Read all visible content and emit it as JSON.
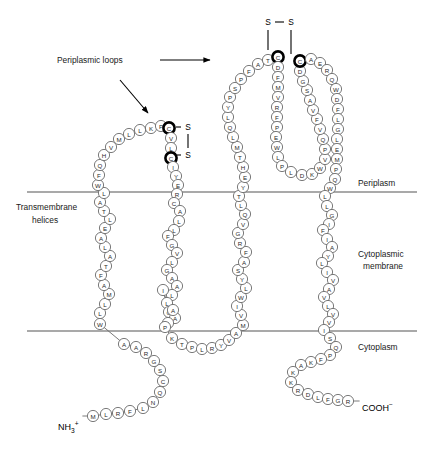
{
  "figure": {
    "annotations": {
      "periplasmic_loops": "Periplasmic loops",
      "transmembrane_helices_line1": "Transmembrane",
      "transmembrane_helices_line2": "helices"
    },
    "regions": {
      "periplasm": "Periplasm",
      "cytoplasmic_membrane_line1": "Cytoplasmic",
      "cytoplasmic_membrane_line2": "membrane",
      "cytoplasm": "Cytoplasm"
    },
    "termini": {
      "n_terminus_main": "NH",
      "n_terminus_sub": "3",
      "n_terminus_sup": "+",
      "c_terminus_main": "COOH",
      "c_terminus_sup": "−"
    },
    "disulfides": [
      {
        "name": "upper-disulfide",
        "label_left": "S",
        "label_right": "S",
        "orientation": "horizontal"
      },
      {
        "name": "lower-disulfide",
        "label_top": "S",
        "label_bottom": "S",
        "orientation": "vertical"
      }
    ],
    "colors": {
      "residue_stroke": "#6b6b6b",
      "residue_fill": "#ffffff",
      "bold_residue_stroke": "#000000",
      "membrane_line": "#555555",
      "text": "#1a1a1a"
    }
  },
  "sequence": {
    "n_terminal_tail": [
      "M",
      "L",
      "R",
      "F",
      "L",
      "N",
      "Q",
      "C",
      "S",
      "G",
      "R",
      "A",
      "A"
    ],
    "tm_helix_1": [
      "W",
      "L",
      "L",
      "M",
      "A",
      "F",
      "T",
      "A",
      "L",
      "A",
      "E",
      "L",
      "T",
      "A",
      "L",
      "W",
      "F"
    ],
    "periplasmic_loop_1": [
      "Q",
      "H",
      "V",
      "M",
      "L",
      "L",
      "K",
      "P",
      "C",
      "V",
      "L",
      "C",
      "I",
      "Y",
      "E",
      "R"
    ],
    "tm_helix_2": [
      "C",
      "A",
      "L",
      "L",
      "F",
      "G",
      "V",
      "L",
      "G",
      "A",
      "A",
      "L",
      "L",
      "I",
      "G",
      "A",
      "I",
      "A",
      "P"
    ],
    "cytoplasmic_loop_1": [
      "K",
      "T",
      "P",
      "L",
      "R",
      "Y",
      "V",
      "A"
    ],
    "tm_helix_3": [
      "M",
      "V",
      "I",
      "W",
      "L",
      "Y",
      "S",
      "A",
      "F",
      "R",
      "G",
      "V",
      "Q",
      "L",
      "T",
      "Y",
      "E"
    ],
    "periplasmic_loop_2_ascend": [
      "H",
      "T",
      "M",
      "L",
      "Q",
      "L",
      "Y",
      "P",
      "S",
      "P",
      "F",
      "A",
      "T"
    ],
    "periplasmic_loop_2_inner_down": [
      "C",
      "D",
      "F",
      "M",
      "V",
      "R",
      "F",
      "P",
      "E",
      "W",
      "L",
      "P"
    ],
    "periplasmic_loop_2_inner_bottom": [
      "L",
      "D",
      "K",
      "W"
    ],
    "periplasmic_loop_2_inner_up": [
      "V",
      "P",
      "Q",
      "V",
      "F",
      "V",
      "A",
      "S",
      "G",
      "D",
      "C"
    ],
    "periplasmic_loop_2_descend": [
      "A",
      "E",
      "R",
      "Q",
      "W",
      "D",
      "F",
      "L",
      "G",
      "L",
      "E",
      "M",
      "P",
      "Q"
    ],
    "tm_helix_4": [
      "W",
      "L",
      "L",
      "G",
      "I",
      "F",
      "I",
      "A",
      "Y",
      "L",
      "I",
      "V",
      "A",
      "V",
      "L",
      "V",
      "V",
      "I",
      "S"
    ],
    "c_terminal_tail": [
      "Q",
      "P",
      "F",
      "K",
      "A",
      "K",
      "K",
      "R",
      "D",
      "L",
      "F",
      "G",
      "R"
    ],
    "bold_residues": [
      "periplasmic_loop_1.8",
      "periplasmic_loop_1.11",
      "periplasmic_loop_2_inner_down.0",
      "periplasmic_loop_2_inner_up.10"
    ]
  },
  "geometry": {
    "membrane_top_y": 192,
    "membrane_bottom_y": 331,
    "membrane_x_start": 27,
    "membrane_x_end": 417,
    "residue_radius": 5.6,
    "paths": {
      "n_terminal_tail": [
        [
          93,
          416
        ],
        [
          106,
          414
        ],
        [
          118,
          413
        ],
        [
          130,
          411
        ],
        [
          143,
          408
        ],
        [
          153,
          402
        ],
        [
          160,
          392
        ],
        [
          163,
          381
        ],
        [
          160,
          370
        ],
        [
          154,
          361
        ],
        [
          146,
          353
        ],
        [
          136,
          347
        ],
        [
          124,
          344
        ],
        [
          113,
          340
        ],
        [
          104,
          333
        ]
      ],
      "tm_helix_1": [
        [
          100,
          324
        ],
        [
          100,
          313
        ],
        [
          105,
          304
        ],
        [
          109,
          294
        ],
        [
          104,
          285
        ],
        [
          101,
          275
        ],
        [
          106,
          266
        ],
        [
          110,
          256
        ],
        [
          105,
          247
        ],
        [
          101,
          238
        ],
        [
          105,
          228
        ],
        [
          110,
          219
        ],
        [
          104,
          211
        ],
        [
          100,
          202
        ],
        [
          104,
          193
        ],
        [
          98,
          185
        ],
        [
          99,
          175
        ]
      ],
      "periplasmic_loop_1": [
        [
          100,
          165
        ],
        [
          104,
          155
        ],
        [
          111,
          147
        ],
        [
          119,
          139
        ],
        [
          129,
          134
        ],
        [
          140,
          130
        ],
        [
          151,
          128
        ],
        [
          161,
          126
        ],
        [
          169,
          128
        ],
        [
          171,
          138
        ],
        [
          171,
          148
        ],
        [
          171,
          158
        ],
        [
          173,
          167
        ],
        [
          176,
          176
        ],
        [
          178,
          185
        ],
        [
          177,
          194
        ]
      ],
      "tm_helix_2": [
        [
          174,
          203
        ],
        [
          180,
          211
        ],
        [
          179,
          221
        ],
        [
          174,
          230
        ],
        [
          168,
          236
        ],
        [
          172,
          245
        ],
        [
          177,
          253
        ],
        [
          172,
          262
        ],
        [
          167,
          270
        ],
        [
          172,
          278
        ],
        [
          177,
          286
        ],
        [
          172,
          295
        ],
        [
          167,
          303
        ],
        [
          163,
          290
        ],
        [
          169,
          312
        ],
        [
          175,
          318
        ],
        [
          168,
          323
        ],
        [
          173,
          310
        ],
        [
          165,
          327
        ]
      ],
      "cytoplasmic_loop_1": [
        [
          172,
          338
        ],
        [
          182,
          344
        ],
        [
          192,
          347
        ],
        [
          202,
          349
        ],
        [
          212,
          348
        ],
        [
          221,
          345
        ],
        [
          229,
          340
        ],
        [
          236,
          333
        ]
      ],
      "tm_helix_3": [
        [
          243,
          325
        ],
        [
          241,
          315
        ],
        [
          237,
          306
        ],
        [
          241,
          297
        ],
        [
          246,
          288
        ],
        [
          242,
          279
        ],
        [
          238,
          270
        ],
        [
          244,
          262
        ],
        [
          246,
          252
        ],
        [
          240,
          243
        ],
        [
          238,
          233
        ],
        [
          243,
          224
        ],
        [
          245,
          214
        ],
        [
          241,
          205
        ],
        [
          239,
          196
        ],
        [
          243,
          187
        ],
        [
          245,
          177
        ]
      ],
      "periplasmic_loop_2_ascend": [
        [
          243,
          167
        ],
        [
          240,
          157
        ],
        [
          237,
          147
        ],
        [
          233,
          137
        ],
        [
          230,
          127
        ],
        [
          228,
          117
        ],
        [
          228,
          107
        ],
        [
          230,
          97
        ],
        [
          235,
          88
        ],
        [
          241,
          79
        ],
        [
          249,
          71
        ],
        [
          258,
          64
        ],
        [
          268,
          60
        ]
      ],
      "periplasmic_loop_2_inner_down": [
        [
          278,
          57
        ],
        [
          278,
          67
        ],
        [
          278,
          77
        ],
        [
          278,
          87
        ],
        [
          278,
          97
        ],
        [
          277,
          107
        ],
        [
          277,
          117
        ],
        [
          277,
          127
        ],
        [
          276,
          137
        ],
        [
          277,
          147
        ],
        [
          278,
          157
        ],
        [
          282,
          166
        ]
      ],
      "periplasmic_loop_2_inner_bottom": [
        [
          291,
          172
        ],
        [
          302,
          175
        ],
        [
          312,
          174
        ],
        [
          320,
          168
        ]
      ],
      "periplasmic_loop_2_inner_up": [
        [
          325,
          159
        ],
        [
          325,
          149
        ],
        [
          323,
          139
        ],
        [
          320,
          129
        ],
        [
          317,
          119
        ],
        [
          313,
          110
        ],
        [
          310,
          100
        ],
        [
          307,
          90
        ],
        [
          303,
          81
        ],
        [
          300,
          71
        ],
        [
          300,
          61
        ]
      ],
      "periplasmic_loop_2_descend": [
        [
          311,
          59
        ],
        [
          320,
          63
        ],
        [
          327,
          70
        ],
        [
          332,
          79
        ],
        [
          336,
          89
        ],
        [
          337,
          99
        ],
        [
          338,
          109
        ],
        [
          338,
          119
        ],
        [
          338,
          129
        ],
        [
          337,
          139
        ],
        [
          337,
          149
        ],
        [
          337,
          159
        ],
        [
          336,
          169
        ],
        [
          335,
          179
        ]
      ],
      "tm_helix_4": [
        [
          330,
          188
        ],
        [
          325,
          196
        ],
        [
          327,
          206
        ],
        [
          332,
          215
        ],
        [
          329,
          224
        ],
        [
          323,
          230
        ],
        [
          327,
          239
        ],
        [
          332,
          247
        ],
        [
          328,
          256
        ],
        [
          322,
          263
        ],
        [
          327,
          272
        ],
        [
          333,
          280
        ],
        [
          329,
          289
        ],
        [
          324,
          297
        ],
        [
          328,
          306
        ],
        [
          333,
          314
        ],
        [
          329,
          322
        ],
        [
          324,
          330
        ],
        [
          330,
          338
        ]
      ],
      "c_terminal_tail": [
        [
          336,
          347
        ],
        [
          330,
          355
        ],
        [
          321,
          359
        ],
        [
          311,
          362
        ],
        [
          301,
          365
        ],
        [
          293,
          372
        ],
        [
          291,
          382
        ],
        [
          298,
          390
        ],
        [
          308,
          394
        ],
        [
          318,
          397
        ],
        [
          328,
          399
        ],
        [
          338,
          400
        ],
        [
          348,
          401
        ]
      ]
    },
    "bond_glyphs": {
      "upper_disulfide": {
        "s_left": [
          268,
          22
        ],
        "s_right": [
          291,
          22
        ],
        "bar": [
          275,
          22,
          284,
          22
        ],
        "stem_left": [
          268,
          30,
          268,
          50
        ],
        "stem_right": [
          291,
          30,
          291,
          54
        ]
      },
      "lower_disulfide": {
        "s_top": [
          188,
          127
        ],
        "s_bottom": [
          188,
          155
        ],
        "bar": [
          188,
          134,
          188,
          148
        ],
        "stem_top": [
          176,
          127,
          181,
          127
        ],
        "stem_bottom": [
          177,
          155,
          181,
          155
        ]
      }
    },
    "arrows": {
      "periplasmic_loops_horizontal": {
        "x1": 160,
        "y1": 60,
        "x2": 210,
        "y2": 60
      },
      "periplasmic_loops_diagonal": {
        "x1": 120,
        "y1": 80,
        "x2": 148,
        "y2": 113
      }
    },
    "label_positions": {
      "periplasmic_loops": [
        57,
        63
      ],
      "transmembrane_helices_1": [
        16,
        210
      ],
      "transmembrane_helices_2": [
        32,
        223
      ],
      "periplasm": [
        358,
        186
      ],
      "cytoplasmic_membrane_1": [
        358,
        257
      ],
      "cytoplasmic_membrane_2": [
        363,
        269
      ],
      "cytoplasm": [
        358,
        350
      ],
      "n_terminus": [
        58,
        430
      ],
      "c_terminus": [
        362,
        411
      ]
    }
  }
}
